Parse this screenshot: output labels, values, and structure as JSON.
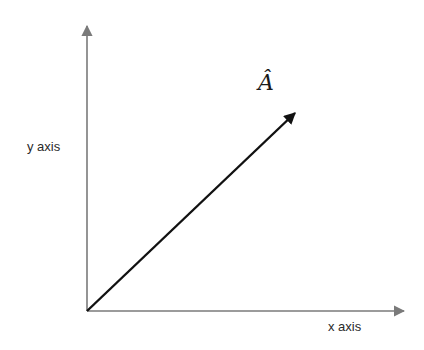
{
  "diagram": {
    "type": "vector-diagram",
    "x_axis_label": "x axis",
    "y_axis_label": "y axis",
    "vector_label": "Â",
    "colors": {
      "axis": "#7a7a7a",
      "vector": "#111111",
      "text": "#2a2a2a"
    },
    "origin": [
      87,
      311
    ],
    "x_axis_end": [
      405,
      311
    ],
    "y_axis_end": [
      87,
      25
    ],
    "vector_end": [
      296,
      112
    ]
  }
}
